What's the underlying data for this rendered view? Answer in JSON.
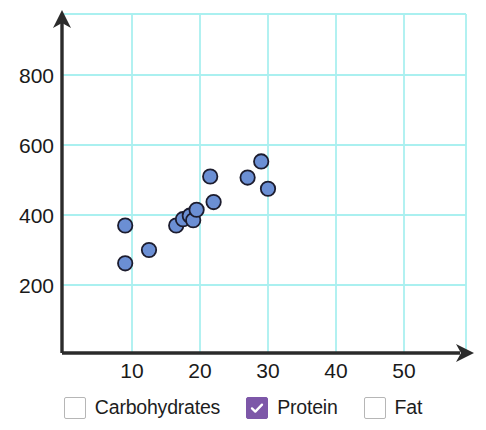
{
  "chart_data": {
    "type": "scatter",
    "title": "",
    "xlabel": "",
    "ylabel": "",
    "xlim": [
      0,
      59
    ],
    "ylim": [
      0,
      960
    ],
    "grid": true,
    "grid_color": "#aaf0f0",
    "xticks": [
      10,
      20,
      30,
      40,
      50
    ],
    "yticks": [
      200,
      400,
      600,
      800
    ],
    "series": [
      {
        "name": "Protein",
        "marker": "circle",
        "color": "#6b8fd4",
        "edge_color": "#1c1c2e",
        "points": [
          {
            "x": 9.0,
            "y": 370
          },
          {
            "x": 9.0,
            "y": 262
          },
          {
            "x": 12.5,
            "y": 300
          },
          {
            "x": 16.5,
            "y": 370
          },
          {
            "x": 17.5,
            "y": 388
          },
          {
            "x": 18.5,
            "y": 398
          },
          {
            "x": 19.0,
            "y": 385
          },
          {
            "x": 19.5,
            "y": 415
          },
          {
            "x": 21.5,
            "y": 510
          },
          {
            "x": 22.0,
            "y": 437
          },
          {
            "x": 27.0,
            "y": 507
          },
          {
            "x": 29.0,
            "y": 553
          },
          {
            "x": 30.0,
            "y": 475
          }
        ]
      }
    ],
    "legend": {
      "position": "bottom",
      "entries": [
        {
          "label": "Carbohydrates",
          "checked": false
        },
        {
          "label": "Protein",
          "checked": true
        },
        {
          "label": "Fat",
          "checked": false
        }
      ]
    }
  },
  "axes": {
    "x_tick_labels": [
      "10",
      "20",
      "30",
      "40",
      "50"
    ],
    "y_tick_labels": [
      "200",
      "400",
      "600",
      "800"
    ],
    "axis_color": "#2b2b2b"
  },
  "legend": {
    "items": [
      {
        "label": "Carbohydrates",
        "checked": false
      },
      {
        "label": "Protein",
        "checked": true
      },
      {
        "label": "Fat",
        "checked": false
      }
    ],
    "checked_color": "#7d57a8",
    "unchecked_border": "#b6b6b6"
  }
}
